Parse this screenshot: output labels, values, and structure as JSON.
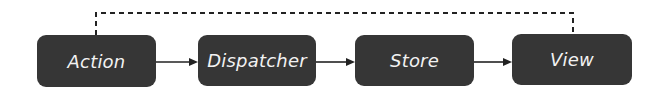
{
  "diagram": {
    "nodes": [
      {
        "id": "action",
        "label": "Action"
      },
      {
        "id": "dispatcher",
        "label": "Dispatcher"
      },
      {
        "id": "store",
        "label": "Store"
      },
      {
        "id": "view",
        "label": "View"
      }
    ],
    "edges": [
      {
        "from": "action",
        "to": "dispatcher",
        "style": "solid-arrow"
      },
      {
        "from": "dispatcher",
        "to": "store",
        "style": "solid-arrow"
      },
      {
        "from": "store",
        "to": "view",
        "style": "solid-arrow"
      },
      {
        "from": "view",
        "to": "action",
        "style": "dashed-line"
      }
    ],
    "colors": {
      "node_fill": "#363636",
      "node_text": "#f2f2f2",
      "edge": "#222222"
    }
  }
}
